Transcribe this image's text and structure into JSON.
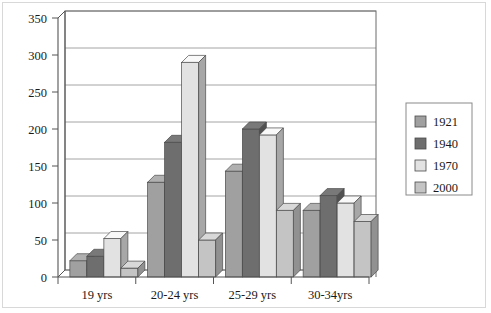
{
  "chart_data": {
    "type": "bar",
    "title": "",
    "xlabel": "",
    "ylabel": "",
    "ylim": [
      0,
      350
    ],
    "ytick_step": 50,
    "yticks": [
      0,
      50,
      100,
      150,
      200,
      250,
      300,
      350
    ],
    "ytick_labels": [
      "0",
      "50",
      "100",
      "150",
      "200",
      "250",
      "300",
      "350"
    ],
    "grid": true,
    "grid_axis": "y",
    "legend_position": "right",
    "style": "3d-bars",
    "categories": [
      "19 yrs",
      "20-24 yrs",
      "25-29 yrs",
      "30-34yrs"
    ],
    "series": [
      {
        "name": "1921",
        "color": "#a0a0a0",
        "values": [
          22,
          128,
          143,
          90
        ]
      },
      {
        "name": "1940",
        "color": "#6e6e6e",
        "values": [
          28,
          182,
          200,
          110
        ]
      },
      {
        "name": "1970",
        "color": "#e2e2e2",
        "values": [
          52,
          290,
          192,
          100
        ]
      },
      {
        "name": "2000",
        "color": "#c4c4c4",
        "values": [
          12,
          50,
          90,
          75
        ]
      }
    ]
  },
  "legend": {
    "entries": [
      {
        "label": "1921",
        "color": "#a0a0a0"
      },
      {
        "label": "1940",
        "color": "#6e6e6e"
      },
      {
        "label": "1970",
        "color": "#e2e2e2"
      },
      {
        "label": "2000",
        "color": "#c4c4c4"
      }
    ]
  },
  "colors": {
    "background": "#ffffff",
    "axis": "#555555",
    "gridline": "#9a9a9a",
    "plot_border": "#6a6a6a",
    "outer_frame": "#d8d8d8",
    "legend_border": "#8a8a8a",
    "bar_outline": "#4a4a4a",
    "text": "#1a1a1a"
  }
}
